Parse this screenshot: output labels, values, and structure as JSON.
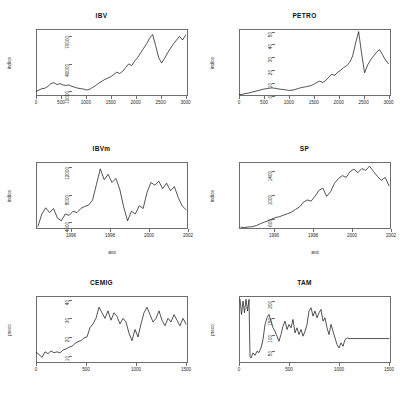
{
  "figure": {
    "background": "#ffffff",
    "line_color": "#0a0a0a",
    "axis_color": "#6e6e6e",
    "layout": "2 columns x 3 rows"
  },
  "chart_data": [
    {
      "type": "line",
      "title": "IBV",
      "xlabel": "",
      "ylabel": "indice",
      "xticks": [
        "0",
        "500",
        "1000",
        "1500",
        "2000",
        "2500",
        "3000"
      ],
      "xtick_values": [
        0,
        500,
        1000,
        1500,
        2000,
        2500,
        3000
      ],
      "yticks": [
        "10000",
        "40000",
        "70000"
      ],
      "ytick_values": [
        10000,
        40000,
        70000
      ],
      "xlim": [
        0,
        3050
      ],
      "ylim": [
        5000,
        78000
      ],
      "grid": false,
      "legend": "none",
      "x": [
        0,
        60,
        120,
        180,
        240,
        300,
        360,
        420,
        480,
        540,
        600,
        660,
        720,
        780,
        840,
        900,
        960,
        1020,
        1080,
        1140,
        1200,
        1260,
        1320,
        1380,
        1440,
        1500,
        1560,
        1620,
        1680,
        1740,
        1800,
        1860,
        1920,
        1980,
        2040,
        2100,
        2160,
        2220,
        2280,
        2340,
        2400,
        2460,
        2520,
        2580,
        2640,
        2700,
        2760,
        2820,
        2880,
        2940,
        3000
      ],
      "values": [
        10000,
        11500,
        13000,
        13500,
        15500,
        18500,
        19500,
        17500,
        18500,
        17000,
        16500,
        17000,
        15500,
        14500,
        13500,
        13000,
        12500,
        11500,
        12500,
        14500,
        16500,
        19000,
        21000,
        23000,
        24500,
        26000,
        28500,
        31000,
        29500,
        32000,
        36000,
        40000,
        38000,
        43000,
        47000,
        52000,
        57000,
        62000,
        68000,
        72000,
        60000,
        47000,
        41000,
        46000,
        52000,
        57000,
        62000,
        66000,
        70000,
        66000,
        71000
      ]
    },
    {
      "type": "line",
      "title": "PETRO",
      "xlabel": "",
      "ylabel": "indice",
      "xticks": [
        "0",
        "500",
        "1000",
        "1500",
        "2000",
        "2500",
        "3000"
      ],
      "xtick_values": [
        0,
        500,
        1000,
        1500,
        2000,
        2500,
        3000
      ],
      "yticks": [
        "0",
        "10",
        "20",
        "30",
        "40",
        "50"
      ],
      "ytick_values": [
        0,
        10,
        20,
        30,
        40,
        50
      ],
      "xlim": [
        0,
        3050
      ],
      "ylim": [
        0,
        52
      ],
      "grid": false,
      "legend": "none",
      "x": [
        0,
        60,
        120,
        180,
        240,
        300,
        360,
        420,
        480,
        540,
        600,
        660,
        720,
        780,
        840,
        900,
        960,
        1020,
        1080,
        1140,
        1200,
        1260,
        1320,
        1380,
        1440,
        1500,
        1560,
        1620,
        1680,
        1740,
        1800,
        1860,
        1920,
        1980,
        2040,
        2100,
        2160,
        2220,
        2280,
        2340,
        2400,
        2460,
        2520,
        2580,
        2640,
        2700,
        2760,
        2820,
        2880,
        2940,
        3000
      ],
      "values": [
        1.0,
        1.3,
        1.8,
        2.2,
        2.8,
        3.4,
        4.0,
        4.6,
        5.2,
        5.6,
        6.0,
        6.3,
        6.0,
        5.6,
        5.2,
        5.0,
        4.6,
        4.3,
        4.6,
        5.2,
        6.0,
        6.6,
        7.0,
        7.5,
        8.0,
        9.0,
        10.5,
        11.5,
        10.5,
        12.0,
        14.5,
        17.0,
        16.0,
        18.5,
        20.0,
        22.0,
        23.5,
        26.0,
        31.0,
        41.0,
        50.0,
        33.0,
        18.0,
        24.0,
        28.0,
        31.0,
        34.0,
        36.0,
        32.0,
        28.0,
        25.0
      ]
    },
    {
      "type": "line",
      "title": "IBVm",
      "xlabel": "ano",
      "ylabel": "indice",
      "xticks": [
        "1996",
        "1998",
        "2000",
        "2002"
      ],
      "xtick_values": [
        1996,
        1998,
        2000,
        2002
      ],
      "yticks": [
        "4000",
        "8000",
        "12000"
      ],
      "ytick_values": [
        4000,
        8000,
        12000
      ],
      "xlim": [
        1994.2,
        2002.0
      ],
      "ylim": [
        3000,
        12800
      ],
      "grid": false,
      "legend": "none",
      "x": [
        1994.3,
        1994.5,
        1994.7,
        1994.9,
        1995.1,
        1995.3,
        1995.5,
        1995.7,
        1995.9,
        1996.1,
        1996.3,
        1996.5,
        1996.7,
        1996.9,
        1997.1,
        1997.3,
        1997.5,
        1997.7,
        1997.9,
        1998.1,
        1998.3,
        1998.5,
        1998.7,
        1998.9,
        1999.1,
        1999.3,
        1999.5,
        1999.7,
        1999.9,
        2000.1,
        2000.3,
        2000.5,
        2000.7,
        2000.9,
        2001.1,
        2001.3,
        2001.5,
        2001.7,
        2001.9
      ],
      "values": [
        3400,
        5200,
        6100,
        5400,
        6000,
        4600,
        4200,
        5200,
        5000,
        5600,
        5400,
        6000,
        6300,
        6500,
        7200,
        9500,
        11800,
        10200,
        11000,
        9800,
        10400,
        8800,
        6200,
        4200,
        5600,
        5200,
        6400,
        6000,
        8400,
        9800,
        9400,
        10000,
        8900,
        9700,
        8600,
        9200,
        7600,
        6400,
        5800
      ]
    },
    {
      "type": "line",
      "title": "SP",
      "xlabel": "ano",
      "ylabel": "indice",
      "xticks": [
        "1996",
        "1998",
        "2000",
        "2002"
      ],
      "xtick_values": [
        1996,
        1998,
        2000,
        2002
      ],
      "yticks": [
        "600",
        "1000",
        "1400"
      ],
      "ytick_values": [
        600,
        1000,
        1400
      ],
      "xlim": [
        1994.2,
        2002.0
      ],
      "ylim": [
        430,
        1560
      ],
      "grid": false,
      "legend": "none",
      "x": [
        1994.3,
        1994.5,
        1994.7,
        1994.9,
        1995.1,
        1995.3,
        1995.5,
        1995.7,
        1995.9,
        1996.1,
        1996.3,
        1996.5,
        1996.7,
        1996.9,
        1997.1,
        1997.3,
        1997.5,
        1997.7,
        1997.9,
        1998.1,
        1998.3,
        1998.5,
        1998.7,
        1998.9,
        1999.1,
        1999.3,
        1999.5,
        1999.7,
        1999.9,
        2000.1,
        2000.3,
        2000.5,
        2000.7,
        2000.9,
        2001.1,
        2001.3,
        2001.5,
        2001.7,
        2001.9
      ],
      "values": [
        460,
        455,
        465,
        470,
        490,
        520,
        545,
        570,
        600,
        625,
        640,
        665,
        690,
        715,
        760,
        800,
        880,
        920,
        900,
        980,
        1080,
        1120,
        980,
        1060,
        1200,
        1280,
        1330,
        1300,
        1400,
        1440,
        1380,
        1450,
        1420,
        1490,
        1400,
        1320,
        1250,
        1300,
        1160
      ]
    },
    {
      "type": "line",
      "title": "CEMIG",
      "xlabel": "",
      "ylabel": "preco",
      "xticks": [
        "0",
        "500",
        "1000",
        "1500"
      ],
      "xtick_values": [
        0,
        500,
        1000,
        1500
      ],
      "yticks": [
        "10",
        "20",
        "30",
        "40"
      ],
      "ytick_values": [
        10,
        20,
        30,
        40
      ],
      "xlim": [
        0,
        1520
      ],
      "ylim": [
        6,
        42
      ],
      "grid": false,
      "legend": "none",
      "x": [
        0,
        30,
        60,
        90,
        120,
        150,
        180,
        210,
        240,
        270,
        300,
        330,
        360,
        390,
        420,
        450,
        480,
        510,
        540,
        570,
        600,
        630,
        660,
        690,
        720,
        750,
        780,
        810,
        840,
        870,
        900,
        930,
        960,
        990,
        1020,
        1050,
        1080,
        1110,
        1140,
        1170,
        1200,
        1230,
        1260,
        1290,
        1320,
        1350,
        1380,
        1410,
        1440,
        1470,
        1500
      ],
      "values": [
        12.0,
        10.5,
        9.0,
        12.0,
        11.0,
        12.5,
        11.5,
        12.0,
        11.5,
        13.0,
        13.5,
        14.5,
        15.0,
        16.5,
        17.5,
        18.0,
        19.5,
        20.0,
        25.0,
        27.0,
        30.0,
        36.0,
        33.0,
        30.0,
        34.0,
        29.0,
        33.0,
        31.0,
        27.0,
        30.0,
        28.0,
        22.0,
        18.0,
        24.0,
        20.0,
        27.0,
        33.0,
        36.0,
        32.0,
        28.0,
        30.0,
        34.0,
        29.0,
        26.0,
        30.0,
        28.0,
        32.0,
        29.0,
        26.0,
        30.0,
        27.0
      ]
    },
    {
      "type": "line",
      "title": "TAM",
      "xlabel": "",
      "ylabel": "preco",
      "xticks": [
        "0",
        "500",
        "1000",
        "1500"
      ],
      "xtick_values": [
        0,
        500,
        1000,
        1500
      ],
      "yticks": [
        "50",
        "100",
        "150",
        "200"
      ],
      "ytick_values": [
        50,
        100,
        150,
        200
      ],
      "xlim": [
        0,
        1520
      ],
      "ylim": [
        15,
        215
      ],
      "grid": false,
      "legend": "none",
      "note": "series becomes constant after about x=1180",
      "x": [
        10,
        25,
        40,
        55,
        70,
        85,
        100,
        110,
        120,
        140,
        160,
        180,
        200,
        220,
        240,
        260,
        280,
        300,
        320,
        340,
        360,
        380,
        400,
        420,
        440,
        460,
        480,
        500,
        520,
        540,
        560,
        580,
        600,
        620,
        640,
        660,
        680,
        700,
        720,
        740,
        760,
        780,
        800,
        820,
        840,
        860,
        880,
        900,
        920,
        940,
        960,
        980,
        1000,
        1020,
        1040,
        1060,
        1080,
        1100,
        1120,
        1140,
        1160,
        1180,
        1300,
        1400,
        1500
      ],
      "values": [
        205,
        160,
        200,
        165,
        205,
        170,
        205,
        35,
        30,
        45,
        38,
        50,
        46,
        60,
        85,
        130,
        150,
        160,
        140,
        120,
        110,
        95,
        80,
        100,
        125,
        140,
        115,
        130,
        120,
        145,
        105,
        120,
        100,
        115,
        95,
        110,
        130,
        170,
        180,
        155,
        170,
        150,
        165,
        175,
        140,
        150,
        120,
        100,
        130,
        110,
        90,
        70,
        60,
        75,
        65,
        85,
        90,
        88,
        88,
        88,
        88,
        88,
        88,
        88,
        88
      ]
    }
  ]
}
